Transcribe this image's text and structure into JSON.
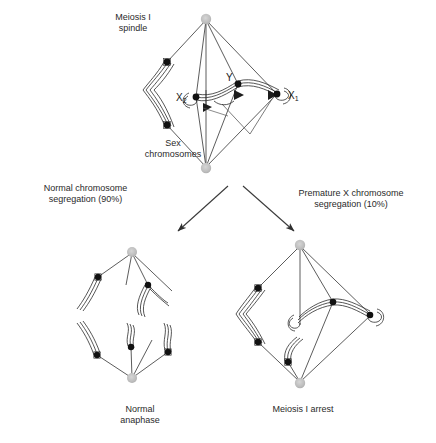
{
  "figure": {
    "background_color": "#ffffff",
    "line_color": "#3a3a3a",
    "chromosome_fill": "#ffffff",
    "kinetochore_color": "#111111",
    "spindle_pole_color": "#bdbdbd",
    "text_color": "#2a2a2a"
  },
  "labels": {
    "meiosis_spindle": "Meiosis I\nspindle",
    "sex_chromosomes": "Sex\nchromosomes",
    "normal_segregation": "Normal chromosome\nsegregation (90%)",
    "premature_segregation": "Premature X chromosome\nsegregation (10%)",
    "normal_anaphase": "Normal\nanaphase",
    "meiosis_arrest": "Meiosis I arrest",
    "x2": "X",
    "x2_sub": "2",
    "y": "Y",
    "x1": "X",
    "x1_sub": "1"
  },
  "percentages": {
    "normal": "90%",
    "premature": "10%"
  },
  "panels": {
    "top": {
      "name": "meiosis-i-spindle",
      "pole_top": [
        206,
        19
      ],
      "pole_bottom": [
        206,
        168
      ],
      "autosome_kinetochores": [
        [
          167,
          62
        ],
        [
          167,
          125
        ]
      ],
      "sex_kinetochores": [
        [
          196,
          97
        ],
        [
          238,
          84
        ],
        [
          277,
          94
        ]
      ],
      "arrowhead_count": 3
    },
    "bottom_left": {
      "name": "normal-anaphase",
      "upper_pole": [
        132,
        253
      ],
      "lower_pole": [
        132,
        378
      ],
      "upper_chromosome_count": 2,
      "lower_chromosome_count": 3,
      "upper_fiber_count": 4,
      "lower_fiber_count": 4
    },
    "bottom_right": {
      "name": "meiosis-i-arrest",
      "pole_top": [
        300,
        245
      ],
      "pole_bottom": [
        300,
        382
      ],
      "autosome_kinetochores": [
        [
          258,
          288
        ],
        [
          258,
          342
        ]
      ],
      "sex_kinetochores": [
        [
          333,
          302
        ],
        [
          370,
          315
        ],
        [
          288,
          362
        ]
      ],
      "fiber_count": 4
    }
  },
  "arrows": [
    {
      "name": "arrow-to-normal",
      "from": [
        228,
        186
      ],
      "to": [
        177,
        232
      ]
    },
    {
      "name": "arrow-to-premature",
      "from": [
        243,
        186
      ],
      "to": [
        295,
        232
      ]
    }
  ]
}
